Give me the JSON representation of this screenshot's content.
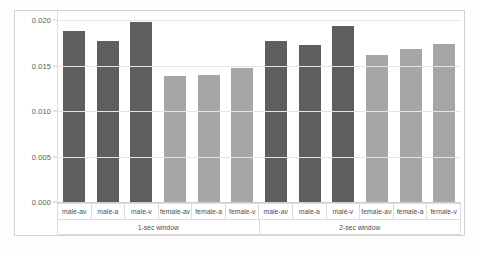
{
  "chart_data": {
    "type": "bar",
    "title": "",
    "subtitle": "",
    "xlabel": "",
    "ylabel": "",
    "ylim": [
      0.0,
      0.02
    ],
    "grid": true,
    "legend": "none",
    "ytick_labels": [
      "0.020",
      "0.015",
      "0.010",
      "0.005",
      "0.000"
    ],
    "ytick_values": [
      0.02,
      0.015,
      0.01,
      0.005,
      0.0
    ],
    "groups": [
      {
        "label": "1-sec window"
      },
      {
        "label": "2-sec window"
      }
    ],
    "categories": [
      "male-av",
      "male-a",
      "male-v",
      "female-av",
      "female-a",
      "female-v",
      "male-av",
      "male-a",
      "male-v",
      "female-av",
      "female-a",
      "female-v"
    ],
    "values": [
      0.0188,
      0.0177,
      0.0198,
      0.0139,
      0.014,
      0.0147,
      0.0177,
      0.0172,
      0.0193,
      0.0162,
      0.0168,
      0.0174
    ],
    "bars": [
      {
        "category": "male-av",
        "group": "1-sec window",
        "value": 0.0188,
        "color": "#5e5e5e"
      },
      {
        "category": "male-a",
        "group": "1-sec window",
        "value": 0.0177,
        "color": "#5e5e5e"
      },
      {
        "category": "male-v",
        "group": "1-sec window",
        "value": 0.0198,
        "color": "#5e5e5e"
      },
      {
        "category": "female-av",
        "group": "1-sec window",
        "value": 0.0139,
        "color": "#a6a6a6"
      },
      {
        "category": "female-a",
        "group": "1-sec window",
        "value": 0.014,
        "color": "#a6a6a6"
      },
      {
        "category": "female-v",
        "group": "1-sec window",
        "value": 0.0147,
        "color": "#a6a6a6"
      },
      {
        "category": "male-av",
        "group": "2-sec window",
        "value": 0.0177,
        "color": "#5e5e5e"
      },
      {
        "category": "male-a",
        "group": "2-sec window",
        "value": 0.0172,
        "color": "#5e5e5e"
      },
      {
        "category": "male-v",
        "group": "2-sec window",
        "value": 0.0193,
        "color": "#5e5e5e"
      },
      {
        "category": "female-av",
        "group": "2-sec window",
        "value": 0.0162,
        "color": "#a6a6a6"
      },
      {
        "category": "female-a",
        "group": "2-sec window",
        "value": 0.0168,
        "color": "#a6a6a6"
      },
      {
        "category": "female-v",
        "group": "2-sec window",
        "value": 0.0174,
        "color": "#a6a6a6"
      }
    ],
    "colors": {
      "male_bar": "#5e5e5e",
      "female_bar": "#a6a6a6",
      "gridline": "#e4e4e4",
      "axis_text": "#5a5a5a",
      "frame": "#d3d3d3",
      "background": "#ffffff"
    }
  }
}
